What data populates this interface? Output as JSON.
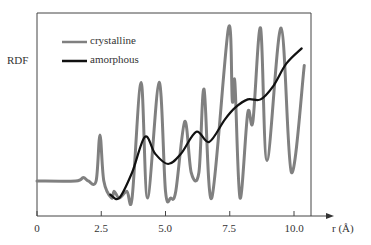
{
  "chart_data": {
    "type": "line",
    "title": "",
    "xlabel": "r (Å)",
    "ylabel": "RDF",
    "xlim": [
      0,
      10.7
    ],
    "xticks": [
      0,
      2.5,
      5.0,
      7.5,
      10.0
    ],
    "xtick_labels": [
      "0",
      "2.5",
      "5.0",
      "7.5",
      "10.0"
    ],
    "grid": false,
    "legend_position": "upper-left",
    "series": [
      {
        "name": "crystalline",
        "color": "#808080",
        "points": [
          [
            0,
            0.1
          ],
          [
            1.5,
            0.1
          ],
          [
            1.8,
            0.12
          ],
          [
            2.0,
            0.1
          ],
          [
            2.3,
            0.1
          ],
          [
            2.45,
            0.37
          ],
          [
            2.6,
            0.1
          ],
          [
            2.9,
            0.0
          ],
          [
            3.0,
            0.04
          ],
          [
            3.2,
            0.0
          ],
          [
            3.5,
            0.04
          ],
          [
            3.7,
            0.0
          ],
          [
            4.05,
            0.68
          ],
          [
            4.3,
            0.0
          ],
          [
            4.75,
            0.68
          ],
          [
            5.0,
            0.04
          ],
          [
            5.2,
            0.0
          ],
          [
            5.4,
            0.04
          ],
          [
            5.75,
            0.45
          ],
          [
            6.0,
            0.15
          ],
          [
            6.3,
            0.15
          ],
          [
            6.5,
            0.64
          ],
          [
            6.8,
            0.0
          ],
          [
            7.45,
            1.0
          ],
          [
            7.6,
            0.57
          ],
          [
            7.7,
            0.68
          ],
          [
            7.9,
            0.0
          ],
          [
            8.2,
            0.5
          ],
          [
            8.4,
            0.45
          ],
          [
            8.7,
            1.0
          ],
          [
            8.95,
            0.22
          ],
          [
            9.5,
            1.0
          ],
          [
            9.9,
            0.15
          ],
          [
            10.4,
            0.78
          ]
        ]
      },
      {
        "name": "amorphous",
        "color": "#111111",
        "points": [
          [
            2.85,
            0.02
          ],
          [
            3.2,
            0.0
          ],
          [
            3.7,
            0.15
          ],
          [
            4.2,
            0.36
          ],
          [
            4.6,
            0.26
          ],
          [
            5.1,
            0.2
          ],
          [
            5.6,
            0.26
          ],
          [
            6.2,
            0.39
          ],
          [
            6.7,
            0.33
          ],
          [
            7.3,
            0.46
          ],
          [
            7.7,
            0.53
          ],
          [
            8.2,
            0.58
          ],
          [
            8.7,
            0.58
          ],
          [
            9.2,
            0.66
          ],
          [
            9.7,
            0.79
          ],
          [
            10.3,
            0.88
          ]
        ]
      }
    ]
  },
  "axis": {
    "ylabel": "RDF",
    "xlabel": "r (Å)",
    "ticks": [
      "0",
      "2.5",
      "5.0",
      "7.5",
      "10.0"
    ]
  },
  "legend": {
    "items": [
      {
        "label": "crystalline",
        "color": "#808080"
      },
      {
        "label": "amorphous",
        "color": "#111111"
      }
    ]
  }
}
